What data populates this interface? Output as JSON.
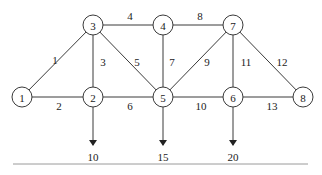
{
  "diagram": {
    "type": "network-graph",
    "nodes": [
      {
        "id": "1",
        "label": "1",
        "x": 22,
        "y": 97
      },
      {
        "id": "2",
        "label": "2",
        "x": 93,
        "y": 97
      },
      {
        "id": "3",
        "label": "3",
        "x": 93,
        "y": 25
      },
      {
        "id": "4",
        "label": "4",
        "x": 163,
        "y": 25
      },
      {
        "id": "5",
        "label": "5",
        "x": 163,
        "y": 97
      },
      {
        "id": "6",
        "label": "6",
        "x": 233,
        "y": 97
      },
      {
        "id": "7",
        "label": "7",
        "x": 233,
        "y": 25
      },
      {
        "id": "8",
        "label": "8",
        "x": 303,
        "y": 97
      }
    ],
    "edges": [
      {
        "id": "e1",
        "from": "1",
        "to": "3",
        "label": "1",
        "lx": 55,
        "ly": 60
      },
      {
        "id": "e2",
        "from": "1",
        "to": "2",
        "label": "2",
        "lx": 59,
        "ly": 106
      },
      {
        "id": "e3",
        "from": "3",
        "to": "2",
        "label": "3",
        "lx": 103,
        "ly": 62
      },
      {
        "id": "e4",
        "from": "3",
        "to": "4",
        "label": "4",
        "lx": 130,
        "ly": 16
      },
      {
        "id": "e5",
        "from": "3",
        "to": "5",
        "label": "5",
        "lx": 137,
        "ly": 62
      },
      {
        "id": "e6",
        "from": "2",
        "to": "5",
        "label": "6",
        "lx": 130,
        "ly": 106
      },
      {
        "id": "e7",
        "from": "4",
        "to": "5",
        "label": "7",
        "lx": 172,
        "ly": 62
      },
      {
        "id": "e8",
        "from": "4",
        "to": "7",
        "label": "8",
        "lx": 200,
        "ly": 16
      },
      {
        "id": "e9",
        "from": "7",
        "to": "5",
        "label": "9",
        "lx": 207,
        "ly": 62
      },
      {
        "id": "e10",
        "from": "5",
        "to": "6",
        "label": "10",
        "lx": 201,
        "ly": 106
      },
      {
        "id": "e11",
        "from": "7",
        "to": "6",
        "label": "11",
        "lx": 246,
        "ly": 62
      },
      {
        "id": "e12",
        "from": "7",
        "to": "8",
        "label": "12",
        "lx": 282,
        "ly": 62
      },
      {
        "id": "e13",
        "from": "6",
        "to": "8",
        "label": "13",
        "lx": 272,
        "ly": 106
      }
    ],
    "demands": [
      {
        "node": "2",
        "value": "10",
        "x": 93
      },
      {
        "node": "5",
        "value": "15",
        "x": 163
      },
      {
        "node": "6",
        "value": "20",
        "x": 233
      }
    ]
  }
}
